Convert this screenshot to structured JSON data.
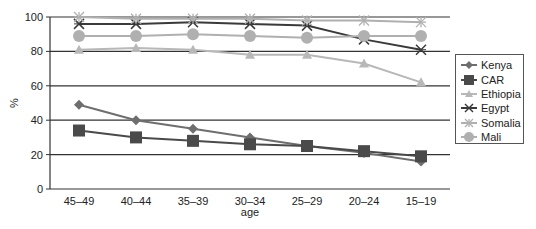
{
  "chart_data": {
    "type": "line",
    "title": "",
    "xlabel": "age",
    "ylabel": "%",
    "ylim": [
      0,
      100
    ],
    "yticks": [
      0,
      20,
      40,
      60,
      80,
      100
    ],
    "grid": true,
    "legend_position": "right",
    "categories": [
      "45–49",
      "40–44",
      "35–39",
      "30–34",
      "25–29",
      "20–24",
      "15–19"
    ],
    "series": [
      {
        "name": "Kenya",
        "marker": "diamond",
        "color": "#6e6e6e",
        "values": [
          49,
          40,
          35,
          30,
          25,
          21,
          16
        ]
      },
      {
        "name": "CAR",
        "marker": "square",
        "color": "#4a4a4a",
        "values": [
          34,
          30,
          28,
          26,
          25,
          22,
          19
        ]
      },
      {
        "name": "Ethiopia",
        "marker": "triangle",
        "color": "#b8b8b8",
        "values": [
          81,
          82,
          81,
          78,
          78,
          73,
          62
        ]
      },
      {
        "name": "Egypt",
        "marker": "x",
        "color": "#3a3a3a",
        "values": [
          96,
          96,
          97,
          96,
          95,
          87,
          81
        ]
      },
      {
        "name": "Somalia",
        "marker": "star",
        "color": "#b0b0b0",
        "values": [
          100,
          99,
          99,
          99,
          98,
          98,
          97
        ]
      },
      {
        "name": "Mali",
        "marker": "circle",
        "color": "#b0b0b0",
        "values": [
          89,
          89,
          90,
          89,
          88,
          89,
          89
        ]
      }
    ]
  }
}
